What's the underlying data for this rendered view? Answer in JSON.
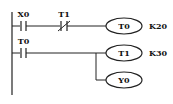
{
  "diagram": {
    "type": "ladder-logic",
    "rungs": [
      {
        "contacts": [
          {
            "label": "X0",
            "kind": "normally-open"
          },
          {
            "label": "T1",
            "kind": "normally-closed"
          }
        ],
        "outputs": [
          {
            "label": "T0",
            "setting": "K20"
          }
        ]
      },
      {
        "contacts": [
          {
            "label": "T0",
            "kind": "normally-open"
          }
        ],
        "outputs": [
          {
            "label": "T1",
            "setting": "K30"
          },
          {
            "label": "Y0",
            "setting": ""
          }
        ]
      }
    ],
    "colors": {
      "line": "#222222",
      "background": "#ffffff"
    }
  }
}
